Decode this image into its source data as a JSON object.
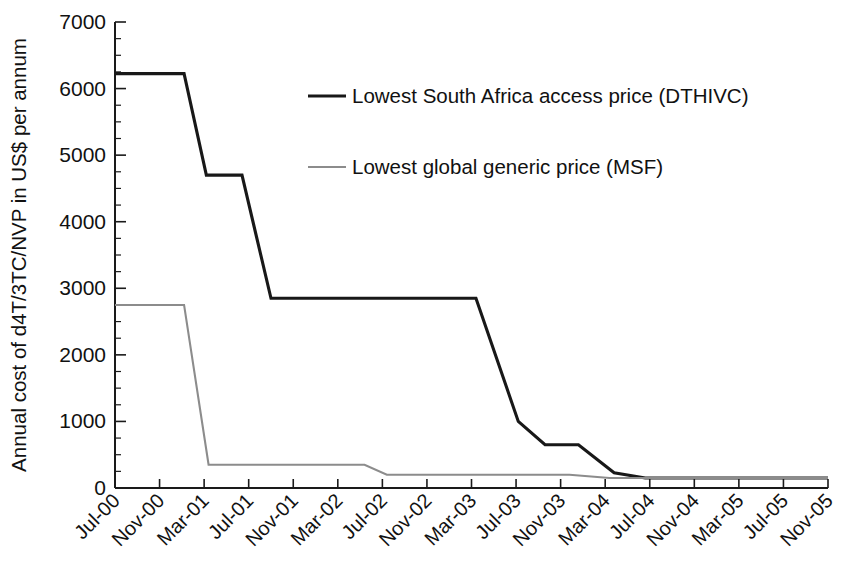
{
  "chart_data": {
    "type": "line",
    "title": "",
    "xlabel": "",
    "ylabel": "Annual cost of d4T/3TC/NVP in US$ per annum",
    "ylim": [
      0,
      7000
    ],
    "ytick_labels": [
      "0",
      "1000",
      "2000",
      "3000",
      "4000",
      "5000",
      "6000",
      "7000"
    ],
    "ytick_values": [
      0,
      1000,
      2000,
      3000,
      4000,
      5000,
      6000,
      7000
    ],
    "yminor_step": 250,
    "grid": false,
    "legend_position": "upper-center",
    "categories": [
      "Jul-00",
      "Nov-00",
      "Mar-01",
      "Jul-01",
      "Nov-01",
      "Mar-02",
      "Jul-02",
      "Nov-02",
      "Mar-03",
      "Jul-03",
      "Nov-03",
      "Mar-04",
      "Jul-04",
      "Nov-04",
      "Mar-05",
      "Jul-05",
      "Nov-05"
    ],
    "xtick_labels": [
      "Jul-00",
      "Nov-00",
      "Mar-01",
      "Jul-01",
      "Nov-01",
      "Mar-02",
      "Jul-02",
      "Nov-02",
      "Mar-03",
      "Jul-03",
      "Nov-03",
      "Mar-04",
      "Jul-04",
      "Nov-04",
      "Mar-05",
      "Jul-05",
      "Nov-05"
    ],
    "series": [
      {
        "name": "Lowest South Africa access price (DTHIVC)",
        "color": "#181818",
        "width": 3.1,
        "points": [
          {
            "x": 0.0,
            "y": 6225
          },
          {
            "x": 1.55,
            "y": 6225
          },
          {
            "x": 2.05,
            "y": 4700
          },
          {
            "x": 2.85,
            "y": 4700
          },
          {
            "x": 3.5,
            "y": 2850
          },
          {
            "x": 8.1,
            "y": 2850
          },
          {
            "x": 9.05,
            "y": 1000
          },
          {
            "x": 9.65,
            "y": 650
          },
          {
            "x": 10.4,
            "y": 650
          },
          {
            "x": 11.2,
            "y": 230
          },
          {
            "x": 11.9,
            "y": 150
          },
          {
            "x": 16.0,
            "y": 150
          }
        ]
      },
      {
        "name": "Lowest global generic price (MSF)",
        "color": "#8c8c8c",
        "width": 2.1,
        "points": [
          {
            "x": 0.0,
            "y": 2750
          },
          {
            "x": 1.55,
            "y": 2750
          },
          {
            "x": 2.1,
            "y": 350
          },
          {
            "x": 5.6,
            "y": 350
          },
          {
            "x": 6.1,
            "y": 200
          },
          {
            "x": 10.2,
            "y": 200
          },
          {
            "x": 11.1,
            "y": 150
          },
          {
            "x": 16.0,
            "y": 150
          }
        ]
      }
    ],
    "legend": [
      {
        "label": "Lowest South Africa access price (DTHIVC)",
        "color": "#181818",
        "width": 3.1
      },
      {
        "label": "Lowest global generic price (MSF)",
        "color": "#8c8c8c",
        "width": 2.1
      }
    ]
  },
  "caption": {
    "text": ""
  }
}
